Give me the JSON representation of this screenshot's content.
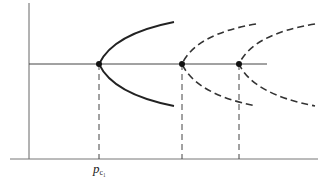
{
  "diagram": {
    "type": "bifurcation-diagram",
    "labels": {
      "critical_point": "p",
      "critical_point_subscript": "c₁"
    },
    "colors": {
      "axis": "#555555",
      "curve": "#222222",
      "dashed": "#333333",
      "background": "#ffffff"
    },
    "bifurcation_points": [
      {
        "id": "pc1",
        "style": "solid",
        "x": 99
      },
      {
        "id": "pc2",
        "style": "dashed",
        "x": 182
      },
      {
        "id": "pc3",
        "style": "dashed",
        "x": 239
      }
    ]
  }
}
